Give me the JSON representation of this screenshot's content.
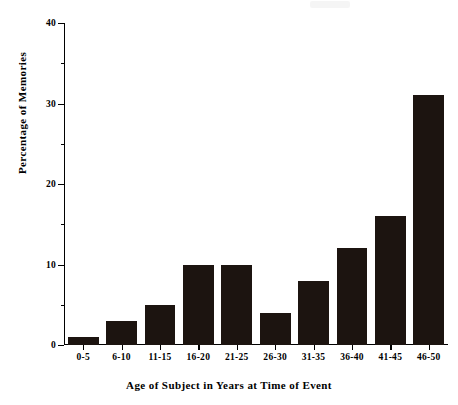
{
  "chart_data": {
    "type": "bar",
    "title": "",
    "xlabel": "Age of Subject in Years at Time of Event",
    "ylabel": "Percentage of Memories",
    "categories": [
      "0-5",
      "6-10",
      "11-15",
      "16-20",
      "21-25",
      "26-30",
      "31-35",
      "36-40",
      "41-45",
      "46-50"
    ],
    "values": [
      1,
      3,
      5,
      10,
      10,
      4,
      8,
      12,
      16,
      31
    ],
    "ylim": [
      0,
      40
    ],
    "xlim_labels": [
      "0-5",
      "46-50"
    ],
    "y_major_ticks": [
      0,
      10,
      20,
      30,
      40
    ],
    "y_minor_ticks": [
      5,
      15,
      25,
      35
    ],
    "y_tick_labels": [
      "0",
      "10",
      "20",
      "30",
      "40"
    ],
    "grid": false,
    "legend": null,
    "bar_color": "#1c1410",
    "axis_color": "#000000",
    "background_color": "#ffffff"
  }
}
